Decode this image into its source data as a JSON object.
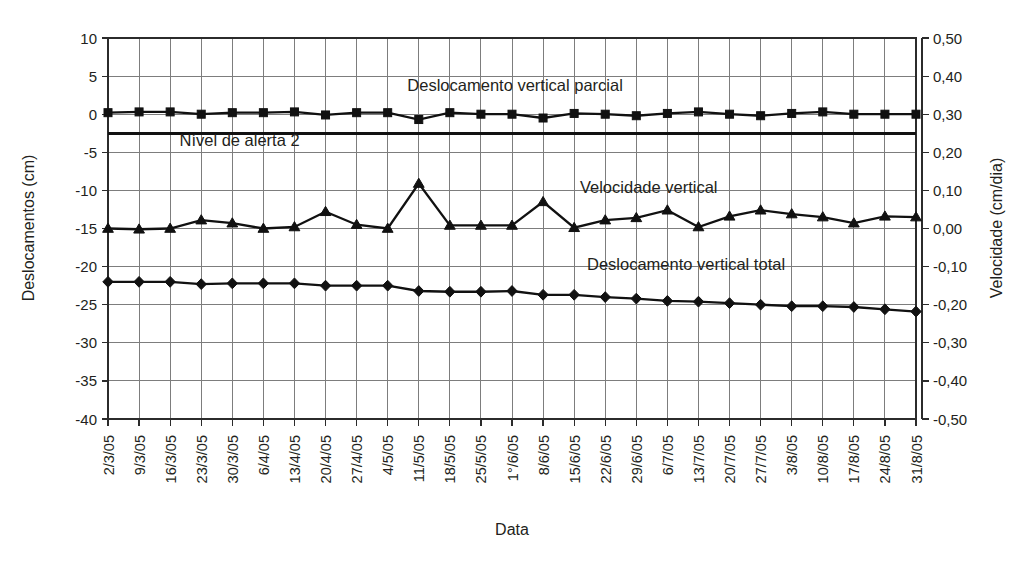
{
  "chart_data": {
    "type": "line",
    "title": "",
    "xlabel": "Data",
    "ylabel": "Deslocamentos (cm)",
    "y2label": "Velocidade (cm/dia)",
    "grid": true,
    "legend_position": "inline-annotations",
    "ylim": [
      -40,
      10
    ],
    "y2lim": [
      -0.5,
      0.5
    ],
    "yticks": [
      "10",
      "5",
      "0",
      "-5",
      "-10",
      "-15",
      "-20",
      "-25",
      "-30",
      "-35",
      "-40"
    ],
    "ytick_values": [
      10,
      5,
      0,
      -5,
      -10,
      -15,
      -20,
      -25,
      -30,
      -35,
      -40
    ],
    "y2ticks": [
      "0,50",
      "0,40",
      "0,30",
      "0,20",
      "0,10",
      "0,00",
      "-0,10",
      "-0,20",
      "-0,30",
      "-0,40",
      "-0,50"
    ],
    "y2tick_values": [
      0.5,
      0.4,
      0.3,
      0.2,
      0.1,
      0.0,
      -0.1,
      -0.2,
      -0.3,
      -0.4,
      -0.5
    ],
    "categories": [
      "2/3/05",
      "9/3/05",
      "16/3/05",
      "23/3/05",
      "30/3/05",
      "6/4/05",
      "13/4/05",
      "20/4/05",
      "27/4/05",
      "4/5/05",
      "11/5/05",
      "18/5/05",
      "25/5/05",
      "1°/6/05",
      "8/6/05",
      "15/6/05",
      "22/6/05",
      "29/6/05",
      "6/7/05",
      "13/7/05",
      "20/7/05",
      "27/7/05",
      "3/8/05",
      "10/8/05",
      "17/8/05",
      "24/8/05",
      "31/8/05"
    ],
    "series": [
      {
        "name": "Deslocamento vertical parcial",
        "axis": "left",
        "marker": "square",
        "values": [
          0.2,
          0.3,
          0.3,
          0.0,
          0.2,
          0.2,
          0.3,
          -0.1,
          0.2,
          0.2,
          -0.7,
          0.2,
          0.0,
          0.0,
          -0.5,
          0.1,
          0.0,
          -0.2,
          0.1,
          0.3,
          0.0,
          -0.2,
          0.1,
          0.3,
          0.0,
          0.0,
          0.0
        ],
        "label_position_index": 13
      },
      {
        "name": "Velocidade vertical",
        "axis": "right",
        "marker": "triangle",
        "values_left_axis": [
          -15.0,
          -15.1,
          -15.0,
          -13.9,
          -14.3,
          -15.0,
          -14.8,
          -12.8,
          -14.5,
          -15.0,
          -9.1,
          -14.6,
          -14.6,
          -14.6,
          -11.5,
          -14.9,
          -13.9,
          -13.6,
          -12.6,
          -14.8,
          -13.4,
          -12.6,
          -13.1,
          -13.5,
          -14.3,
          -13.4,
          -13.5
        ],
        "values": [
          0.0,
          -0.002,
          0.0,
          0.022,
          0.014,
          0.0,
          0.004,
          0.044,
          0.01,
          0.0,
          0.118,
          0.008,
          0.008,
          0.008,
          0.07,
          0.002,
          0.022,
          0.028,
          0.048,
          0.004,
          0.032,
          0.048,
          0.038,
          0.03,
          0.014,
          0.032,
          0.03
        ],
        "label_position_index": 17
      },
      {
        "name": "Deslocamento vertical total",
        "axis": "left",
        "marker": "diamond",
        "values": [
          -22.0,
          -22.0,
          -22.0,
          -22.3,
          -22.2,
          -22.2,
          -22.2,
          -22.5,
          -22.5,
          -22.5,
          -23.2,
          -23.3,
          -23.3,
          -23.2,
          -23.7,
          -23.7,
          -24.0,
          -24.2,
          -24.5,
          -24.6,
          -24.8,
          -25.0,
          -25.2,
          -25.2,
          -25.3,
          -25.6,
          -25.9
        ],
        "label_position_index": 18
      }
    ],
    "reference_lines": [
      {
        "name": "Nível de alerta 2",
        "axis": "left",
        "value": -2.5,
        "label": "Nível de alerta 2",
        "label_x_index": 1
      }
    ],
    "annotations": [
      {
        "text": "Deslocamento vertical parcial",
        "x_index": 13.1,
        "y_value": 3.0,
        "axis": "left"
      },
      {
        "text": "Nível de alerta 2",
        "x_index": 2.3,
        "y_value": -4.2,
        "axis": "left"
      },
      {
        "text": "Velocidade vertical",
        "x_index": 17.4,
        "y_value": -10.4,
        "axis": "left"
      },
      {
        "text": "Deslocamento vertical total",
        "x_index": 18.6,
        "y_value": -20.5,
        "axis": "left"
      }
    ]
  },
  "layout": {
    "plot_left": 108,
    "plot_right": 916,
    "plot_top": 38,
    "plot_bottom": 419,
    "secondary_axis_x": 922
  }
}
